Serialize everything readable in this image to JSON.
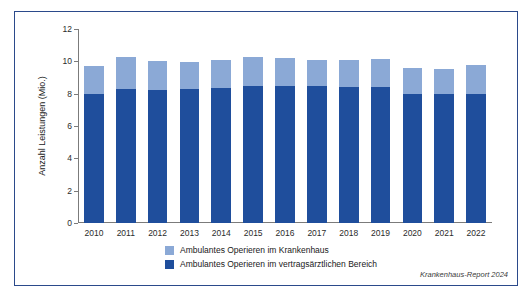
{
  "figure": {
    "source_note": "Krankenhaus-Report 2024",
    "border_color": "#2b4a8b"
  },
  "legend": {
    "items": [
      {
        "label": "Ambulantes Operieren im Krankenhaus",
        "color": "#8ba9d6"
      },
      {
        "label": "Ambulantes Operieren im vertragsärztlichen Bereich",
        "color": "#1f4e9c"
      }
    ]
  },
  "chart_data": {
    "type": "bar",
    "title": "",
    "xlabel": "",
    "ylabel": "Anzahl Leistungen (Mio.)",
    "ylim": [
      0,
      12
    ],
    "yticks": [
      0,
      2,
      4,
      6,
      8,
      10,
      12
    ],
    "ytick_labels": [
      "0",
      "2",
      "4",
      "6",
      "8",
      "10",
      "12"
    ],
    "grid": false,
    "stacked": true,
    "legend_position": "bottom-left",
    "categories": [
      "2010",
      "2011",
      "2012",
      "2013",
      "2014",
      "2015",
      "2016",
      "2017",
      "2018",
      "2019",
      "2020",
      "2021",
      "2022"
    ],
    "series": [
      {
        "name": "Ambulantes Operieren im vertragsärztlichen Bereich",
        "color": "#1f4e9c",
        "values": [
          8.0,
          8.3,
          8.25,
          8.3,
          8.35,
          8.5,
          8.5,
          8.45,
          8.4,
          8.4,
          8.0,
          7.95,
          8.0
        ]
      },
      {
        "name": "Ambulantes Operieren im Krankenhaus",
        "color": "#8ba9d6",
        "values": [
          1.7,
          1.95,
          1.8,
          1.65,
          1.75,
          1.8,
          1.7,
          1.65,
          1.7,
          1.75,
          1.6,
          1.6,
          1.75
        ]
      }
    ],
    "totals": [
      9.7,
      10.25,
      10.05,
      9.95,
      10.1,
      10.3,
      10.2,
      10.1,
      10.1,
      10.15,
      9.6,
      9.55,
      9.75
    ]
  }
}
